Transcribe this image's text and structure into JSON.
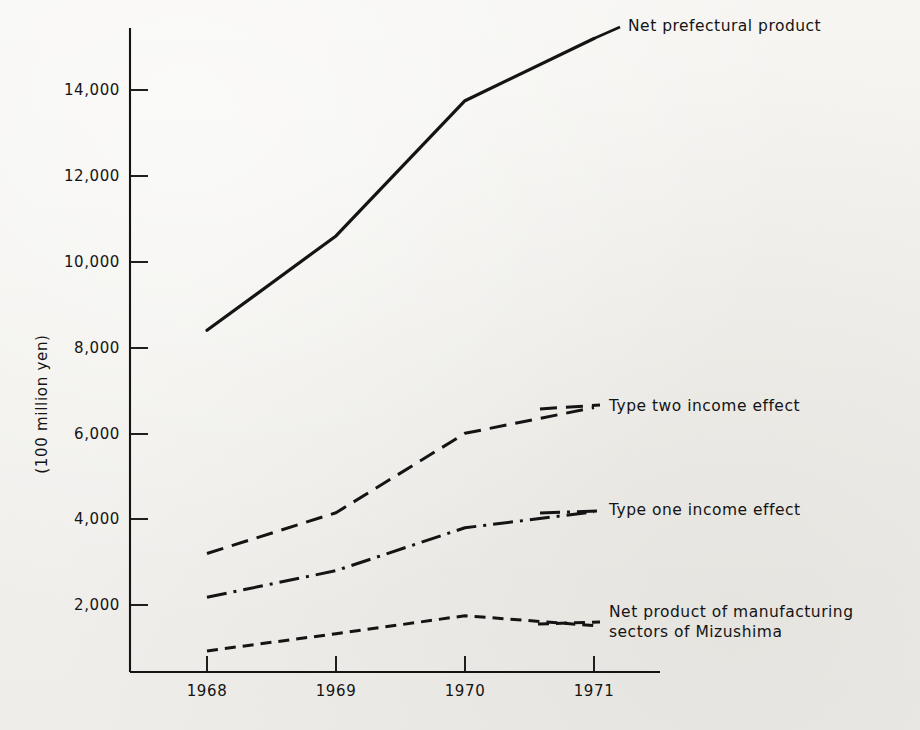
{
  "figure": {
    "y_axis_title": "(100 million yen)",
    "background_color": "#f3f2ef",
    "ink_color": "#141414"
  },
  "axes": {
    "y_tick_labels": [
      "14,000",
      "12,000",
      "10,000",
      "8,000",
      "6,000",
      "4,000",
      "2,000"
    ],
    "x_tick_labels": [
      "1968",
      "1969",
      "1970",
      "1971"
    ]
  },
  "series_labels": {
    "net_prefectural_product": "Net prefectural product",
    "type_two_income_effect": "Type two income effect",
    "type_one_income_effect": "Type one income effect",
    "net_product_manufacturing": "Net product of manufacturing\nsectors of Mizushima"
  },
  "chart_data": {
    "type": "line",
    "title": "",
    "subtitle": "",
    "xlabel": "",
    "ylabel": "(100 million yen)",
    "categories": [
      "1968",
      "1969",
      "1970",
      "1971"
    ],
    "x": [
      1968,
      1969,
      1970,
      1971
    ],
    "ylim": [
      0,
      15500
    ],
    "xlim": [
      1967.6,
      1971.5
    ],
    "y_ticks": [
      2000,
      4000,
      6000,
      8000,
      10000,
      12000,
      14000
    ],
    "y_tick_labels": [
      "2,000",
      "4,000",
      "6,000",
      "8,000",
      "10,000",
      "12,000",
      "14,000"
    ],
    "grid": false,
    "legend_position": "inline-right-of-line-ends",
    "series": [
      {
        "name": "Net prefectural product",
        "line_style": "solid",
        "color": "#141414",
        "values": [
          8400,
          10600,
          13750,
          15200
        ]
      },
      {
        "name": "Type two income effect",
        "line_style": "dashed",
        "color": "#141414",
        "values": [
          3200,
          4150,
          6000,
          6600
        ]
      },
      {
        "name": "Type one income effect",
        "line_style": "dashdot",
        "color": "#141414",
        "values": [
          2180,
          2800,
          3800,
          4170
        ]
      },
      {
        "name": "Net product of manufacturing sectors of Mizushima",
        "line_style": "finely-dashed",
        "color": "#141414",
        "values": [
          930,
          1330,
          1750,
          1520
        ]
      }
    ]
  }
}
